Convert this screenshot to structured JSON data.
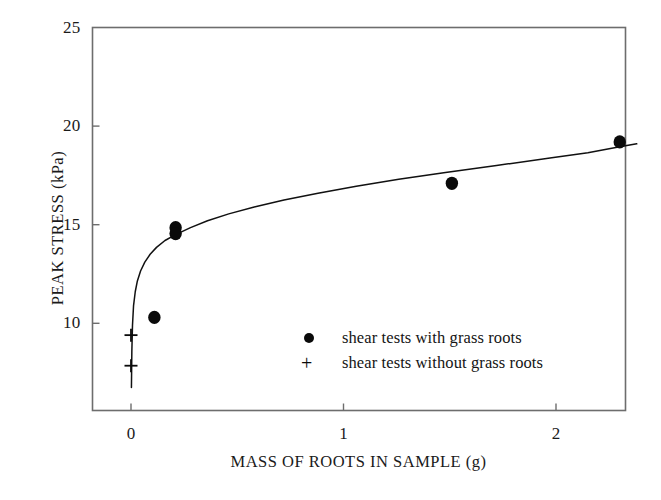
{
  "chart_data": {
    "type": "scatter",
    "title": "",
    "xlabel": "MASS OF ROOTS IN SAMPLE (g)",
    "ylabel": "PEAK STRESS (kPa)",
    "xlim": [
      -0.1,
      2.44
    ],
    "ylim": [
      6.7,
      25
    ],
    "xticks": [
      0,
      1,
      2
    ],
    "xticklabels": [
      "0",
      "1",
      "2"
    ],
    "yticks": [
      10,
      15,
      20,
      25
    ],
    "yticklabels": [
      "10",
      "15",
      "20",
      "25"
    ],
    "grid": false,
    "legend_position": "lower-right-inside",
    "series": [
      {
        "name": "shear tests with grass roots",
        "marker": "filled-circle",
        "color": "#0a0a0a",
        "points": [
          {
            "x": 0.11,
            "y": 10.3
          },
          {
            "x": 0.21,
            "y": 14.85
          },
          {
            "x": 0.21,
            "y": 14.55
          },
          {
            "x": 1.51,
            "y": 17.1
          },
          {
            "x": 2.3,
            "y": 19.2
          }
        ]
      },
      {
        "name": "shear tests without grass roots",
        "marker": "plus",
        "color": "#0a0a0a",
        "points": [
          {
            "x": 0.0,
            "y": 9.4
          },
          {
            "x": 0.0,
            "y": 7.85
          }
        ]
      }
    ],
    "fit_curve": {
      "name": "power-law trend line",
      "color": "#111111",
      "points": [
        {
          "x": 0.002,
          "y": 6.75
        },
        {
          "x": 0.004,
          "y": 8.6
        },
        {
          "x": 0.007,
          "y": 9.9
        },
        {
          "x": 0.012,
          "y": 10.9
        },
        {
          "x": 0.02,
          "y": 11.6
        },
        {
          "x": 0.03,
          "y": 12.15
        },
        {
          "x": 0.045,
          "y": 12.65
        },
        {
          "x": 0.065,
          "y": 13.1
        },
        {
          "x": 0.09,
          "y": 13.5
        },
        {
          "x": 0.12,
          "y": 13.85
        },
        {
          "x": 0.16,
          "y": 14.2
        },
        {
          "x": 0.21,
          "y": 14.5
        },
        {
          "x": 0.28,
          "y": 14.85
        },
        {
          "x": 0.36,
          "y": 15.2
        },
        {
          "x": 0.46,
          "y": 15.55
        },
        {
          "x": 0.58,
          "y": 15.9
        },
        {
          "x": 0.72,
          "y": 16.25
        },
        {
          "x": 0.88,
          "y": 16.6
        },
        {
          "x": 1.06,
          "y": 16.95
        },
        {
          "x": 1.26,
          "y": 17.3
        },
        {
          "x": 1.48,
          "y": 17.65
        },
        {
          "x": 1.72,
          "y": 18.0
        },
        {
          "x": 1.98,
          "y": 18.4
        },
        {
          "x": 2.15,
          "y": 18.65
        },
        {
          "x": 2.3,
          "y": 18.95
        },
        {
          "x": 2.38,
          "y": 19.1
        }
      ]
    },
    "legend": [
      {
        "marker": "filled-circle",
        "label": "shear tests with grass roots"
      },
      {
        "marker": "plus",
        "label": "shear tests without grass roots"
      }
    ]
  },
  "axes": {
    "x_title": "MASS OF ROOTS IN SAMPLE (g)",
    "y_title": "PEAK STRESS (kPa)",
    "x_tick_labels": [
      "0",
      "1",
      "2"
    ],
    "y_tick_labels": [
      "25",
      "20",
      "15",
      "10"
    ]
  },
  "legend": {
    "items": [
      {
        "label": "shear tests with grass roots",
        "glyph": "●"
      },
      {
        "label": "shear tests without grass roots",
        "glyph": "+"
      }
    ]
  },
  "style": {
    "frame_color": "#6d6d6d",
    "marker_color": "#0a0a0a",
    "curve_color": "#111111",
    "background": "#ffffff"
  }
}
